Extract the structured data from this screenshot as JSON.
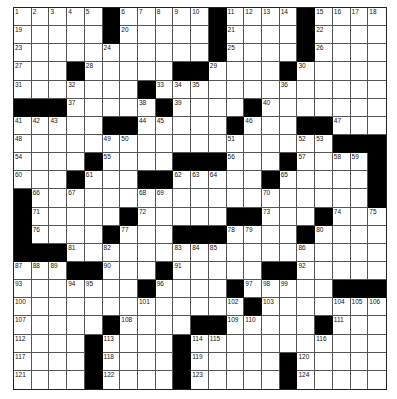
{
  "puzzle": {
    "type": "crossword",
    "columns": 21,
    "rows": 21,
    "colors": {
      "black": "#000000",
      "white": "#ffffff",
      "line": "#555555"
    },
    "layout": [
      ".....#.....#....#....",
      ".....#.....#....#....",
      "...........#....#....",
      "...#.....##....#.....",
      ".......#.............",
      "###.....#....#.......",
      ".....##.....#...##...",
      "..................###",
      "....#....###...#....#",
      "...#...##.....#.....#",
      "#...................#",
      "#.....#.....##...#...",
      "#....#...###....#....",
      "###..................",
      "...##...#.....##.....",
      ".......#....#.....###",
      ".............#.......",
      ".....#....##.....#...",
      "....#....#...........",
      "....#....#.....#.....",
      "....#....#.....#....."
    ],
    "numbers": [
      {
        "n": "1",
        "r": 0,
        "c": 0
      },
      {
        "n": "2",
        "r": 0,
        "c": 1
      },
      {
        "n": "3",
        "r": 0,
        "c": 2
      },
      {
        "n": "4",
        "r": 0,
        "c": 3
      },
      {
        "n": "5",
        "r": 0,
        "c": 4
      },
      {
        "n": "6",
        "r": 0,
        "c": 6
      },
      {
        "n": "7",
        "r": 0,
        "c": 7
      },
      {
        "n": "8",
        "r": 0,
        "c": 8
      },
      {
        "n": "9",
        "r": 0,
        "c": 9
      },
      {
        "n": "10",
        "r": 0,
        "c": 10
      },
      {
        "n": "11",
        "r": 0,
        "c": 12
      },
      {
        "n": "12",
        "r": 0,
        "c": 13
      },
      {
        "n": "13",
        "r": 0,
        "c": 14
      },
      {
        "n": "14",
        "r": 0,
        "c": 15
      },
      {
        "n": "15",
        "r": 0,
        "c": 17
      },
      {
        "n": "16",
        "r": 0,
        "c": 18
      },
      {
        "n": "17",
        "r": 0,
        "c": 19
      },
      {
        "n": "18",
        "r": 0,
        "c": 20
      },
      {
        "n": "19",
        "r": 1,
        "c": 0
      },
      {
        "n": "20",
        "r": 1,
        "c": 6
      },
      {
        "n": "21",
        "r": 1,
        "c": 12
      },
      {
        "n": "22",
        "r": 1,
        "c": 17
      },
      {
        "n": "23",
        "r": 2,
        "c": 0
      },
      {
        "n": "24",
        "r": 2,
        "c": 5
      },
      {
        "n": "25",
        "r": 2,
        "c": 12
      },
      {
        "n": "26",
        "r": 2,
        "c": 17
      },
      {
        "n": "27",
        "r": 3,
        "c": 0
      },
      {
        "n": "28",
        "r": 3,
        "c": 4
      },
      {
        "n": "29",
        "r": 3,
        "c": 11
      },
      {
        "n": "30",
        "r": 3,
        "c": 16
      },
      {
        "n": "31",
        "r": 4,
        "c": 0
      },
      {
        "n": "32",
        "r": 4,
        "c": 3
      },
      {
        "n": "33",
        "r": 4,
        "c": 8
      },
      {
        "n": "34",
        "r": 4,
        "c": 9
      },
      {
        "n": "35",
        "r": 4,
        "c": 10
      },
      {
        "n": "36",
        "r": 4,
        "c": 15
      },
      {
        "n": "37",
        "r": 5,
        "c": 3
      },
      {
        "n": "38",
        "r": 5,
        "c": 7
      },
      {
        "n": "39",
        "r": 5,
        "c": 9
      },
      {
        "n": "40",
        "r": 5,
        "c": 14
      },
      {
        "n": "41",
        "r": 6,
        "c": 0
      },
      {
        "n": "42",
        "r": 6,
        "c": 1
      },
      {
        "n": "43",
        "r": 6,
        "c": 2
      },
      {
        "n": "44",
        "r": 6,
        "c": 7
      },
      {
        "n": "45",
        "r": 6,
        "c": 8
      },
      {
        "n": "46",
        "r": 6,
        "c": 13
      },
      {
        "n": "47",
        "r": 6,
        "c": 18
      },
      {
        "n": "48",
        "r": 7,
        "c": 0
      },
      {
        "n": "49",
        "r": 7,
        "c": 5
      },
      {
        "n": "50",
        "r": 7,
        "c": 6
      },
      {
        "n": "51",
        "r": 7,
        "c": 12
      },
      {
        "n": "52",
        "r": 7,
        "c": 16
      },
      {
        "n": "53",
        "r": 7,
        "c": 17
      },
      {
        "n": "54",
        "r": 8,
        "c": 0
      },
      {
        "n": "55",
        "r": 8,
        "c": 5
      },
      {
        "n": "56",
        "r": 8,
        "c": 12
      },
      {
        "n": "57",
        "r": 8,
        "c": 16
      },
      {
        "n": "58",
        "r": 8,
        "c": 18
      },
      {
        "n": "59",
        "r": 8,
        "c": 19
      },
      {
        "n": "60",
        "r": 9,
        "c": 0
      },
      {
        "n": "61",
        "r": 9,
        "c": 4
      },
      {
        "n": "62",
        "r": 9,
        "c": 9
      },
      {
        "n": "63",
        "r": 9,
        "c": 10
      },
      {
        "n": "64",
        "r": 9,
        "c": 11
      },
      {
        "n": "65",
        "r": 9,
        "c": 15
      },
      {
        "n": "66",
        "r": 10,
        "c": 1
      },
      {
        "n": "67",
        "r": 10,
        "c": 3
      },
      {
        "n": "68",
        "r": 10,
        "c": 7
      },
      {
        "n": "69",
        "r": 10,
        "c": 8
      },
      {
        "n": "70",
        "r": 10,
        "c": 14
      },
      {
        "n": "71",
        "r": 11,
        "c": 1
      },
      {
        "n": "72",
        "r": 11,
        "c": 7
      },
      {
        "n": "73",
        "r": 11,
        "c": 14
      },
      {
        "n": "74",
        "r": 11,
        "c": 18
      },
      {
        "n": "75",
        "r": 11,
        "c": 20
      },
      {
        "n": "76",
        "r": 12,
        "c": 1
      },
      {
        "n": "77",
        "r": 12,
        "c": 6
      },
      {
        "n": "78",
        "r": 12,
        "c": 12
      },
      {
        "n": "79",
        "r": 12,
        "c": 13
      },
      {
        "n": "80",
        "r": 12,
        "c": 17
      },
      {
        "n": "81",
        "r": 13,
        "c": 3
      },
      {
        "n": "82",
        "r": 13,
        "c": 5
      },
      {
        "n": "83",
        "r": 13,
        "c": 9
      },
      {
        "n": "84",
        "r": 13,
        "c": 10
      },
      {
        "n": "85",
        "r": 13,
        "c": 11
      },
      {
        "n": "86",
        "r": 13,
        "c": 16
      },
      {
        "n": "87",
        "r": 14,
        "c": 0
      },
      {
        "n": "88",
        "r": 14,
        "c": 1
      },
      {
        "n": "89",
        "r": 14,
        "c": 2
      },
      {
        "n": "90",
        "r": 14,
        "c": 5
      },
      {
        "n": "91",
        "r": 14,
        "c": 9
      },
      {
        "n": "92",
        "r": 14,
        "c": 16
      },
      {
        "n": "93",
        "r": 15,
        "c": 0
      },
      {
        "n": "94",
        "r": 15,
        "c": 3
      },
      {
        "n": "95",
        "r": 15,
        "c": 4
      },
      {
        "n": "96",
        "r": 15,
        "c": 8
      },
      {
        "n": "97",
        "r": 15,
        "c": 13
      },
      {
        "n": "98",
        "r": 15,
        "c": 14
      },
      {
        "n": "99",
        "r": 15,
        "c": 15
      },
      {
        "n": "100",
        "r": 16,
        "c": 0
      },
      {
        "n": "101",
        "r": 16,
        "c": 7
      },
      {
        "n": "102",
        "r": 16,
        "c": 12
      },
      {
        "n": "103",
        "r": 16,
        "c": 14
      },
      {
        "n": "104",
        "r": 16,
        "c": 18
      },
      {
        "n": "105",
        "r": 16,
        "c": 19
      },
      {
        "n": "106",
        "r": 16,
        "c": 20
      },
      {
        "n": "107",
        "r": 17,
        "c": 0
      },
      {
        "n": "108",
        "r": 17,
        "c": 6
      },
      {
        "n": "109",
        "r": 17,
        "c": 12
      },
      {
        "n": "110",
        "r": 17,
        "c": 13
      },
      {
        "n": "111",
        "r": 17,
        "c": 18
      },
      {
        "n": "112",
        "r": 18,
        "c": 0
      },
      {
        "n": "113",
        "r": 18,
        "c": 5
      },
      {
        "n": "114",
        "r": 18,
        "c": 10
      },
      {
        "n": "115",
        "r": 18,
        "c": 11
      },
      {
        "n": "116",
        "r": 18,
        "c": 17
      },
      {
        "n": "117",
        "r": 19,
        "c": 0
      },
      {
        "n": "118",
        "r": 19,
        "c": 5
      },
      {
        "n": "119",
        "r": 19,
        "c": 10
      },
      {
        "n": "120",
        "r": 19,
        "c": 16
      },
      {
        "n": "121",
        "r": 20,
        "c": 0
      },
      {
        "n": "122",
        "r": 20,
        "c": 5
      },
      {
        "n": "123",
        "r": 20,
        "c": 10
      },
      {
        "n": "124",
        "r": 20,
        "c": 16
      }
    ]
  }
}
